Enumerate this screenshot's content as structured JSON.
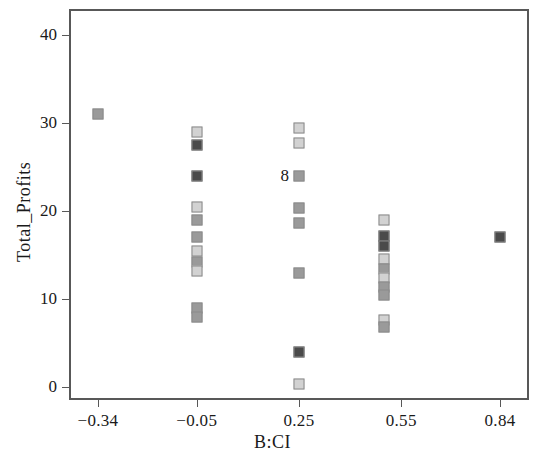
{
  "chart_data": {
    "type": "scatter",
    "title": "",
    "xlabel": "B:CI",
    "ylabel": "Total_Profits",
    "xticks": [
      -0.34,
      -0.05,
      0.25,
      0.55,
      0.84
    ],
    "xtick_labels": [
      "−0.34",
      "−0.05",
      "0.25",
      "0.55",
      "0.84"
    ],
    "yticks": [
      0,
      10,
      20,
      30,
      40
    ],
    "ytick_labels": [
      "0",
      "10",
      "20",
      "30",
      "40"
    ],
    "xlim": [
      -0.425,
      0.925
    ],
    "ylim": [
      -1.5,
      43.0
    ],
    "grid": false,
    "legend": null,
    "marker_shape": "square",
    "colors": {
      "light": "#d2d2d2",
      "mid": "#9a9a9a",
      "dark": "#4a4a4a",
      "edge": "#8a8a8a",
      "axis": "#585858",
      "text": "#1a1a1a"
    },
    "annotations": [
      {
        "text": "8",
        "x": 0.25,
        "y": 24.0
      }
    ],
    "points": [
      {
        "x": -0.34,
        "y": 31.0,
        "shade": "mid"
      },
      {
        "x": -0.05,
        "y": 29.0,
        "shade": "light"
      },
      {
        "x": -0.05,
        "y": 27.5,
        "shade": "dark"
      },
      {
        "x": -0.05,
        "y": 24.0,
        "shade": "dark"
      },
      {
        "x": -0.05,
        "y": 20.5,
        "shade": "light"
      },
      {
        "x": -0.05,
        "y": 19.0,
        "shade": "mid"
      },
      {
        "x": -0.05,
        "y": 17.0,
        "shade": "mid"
      },
      {
        "x": -0.05,
        "y": 15.5,
        "shade": "light"
      },
      {
        "x": -0.05,
        "y": 14.2,
        "shade": "mid"
      },
      {
        "x": -0.05,
        "y": 13.2,
        "shade": "light"
      },
      {
        "x": -0.05,
        "y": 9.0,
        "shade": "mid"
      },
      {
        "x": -0.05,
        "y": 8.0,
        "shade": "mid"
      },
      {
        "x": 0.25,
        "y": 29.5,
        "shade": "light"
      },
      {
        "x": 0.25,
        "y": 27.8,
        "shade": "light"
      },
      {
        "x": 0.25,
        "y": 24.0,
        "shade": "mid"
      },
      {
        "x": 0.25,
        "y": 20.3,
        "shade": "mid"
      },
      {
        "x": 0.25,
        "y": 18.6,
        "shade": "mid"
      },
      {
        "x": 0.25,
        "y": 13.0,
        "shade": "mid"
      },
      {
        "x": 0.25,
        "y": 4.0,
        "shade": "dark"
      },
      {
        "x": 0.25,
        "y": 0.3,
        "shade": "light"
      },
      {
        "x": 0.5,
        "y": 19.0,
        "shade": "light"
      },
      {
        "x": 0.5,
        "y": 17.2,
        "shade": "dark"
      },
      {
        "x": 0.5,
        "y": 16.0,
        "shade": "dark"
      },
      {
        "x": 0.5,
        "y": 14.5,
        "shade": "light"
      },
      {
        "x": 0.5,
        "y": 13.4,
        "shade": "mid"
      },
      {
        "x": 0.5,
        "y": 12.4,
        "shade": "light"
      },
      {
        "x": 0.5,
        "y": 11.4,
        "shade": "mid"
      },
      {
        "x": 0.5,
        "y": 10.4,
        "shade": "mid"
      },
      {
        "x": 0.5,
        "y": 7.6,
        "shade": "light"
      },
      {
        "x": 0.5,
        "y": 6.8,
        "shade": "mid"
      },
      {
        "x": 0.84,
        "y": 17.0,
        "shade": "dark"
      }
    ]
  }
}
